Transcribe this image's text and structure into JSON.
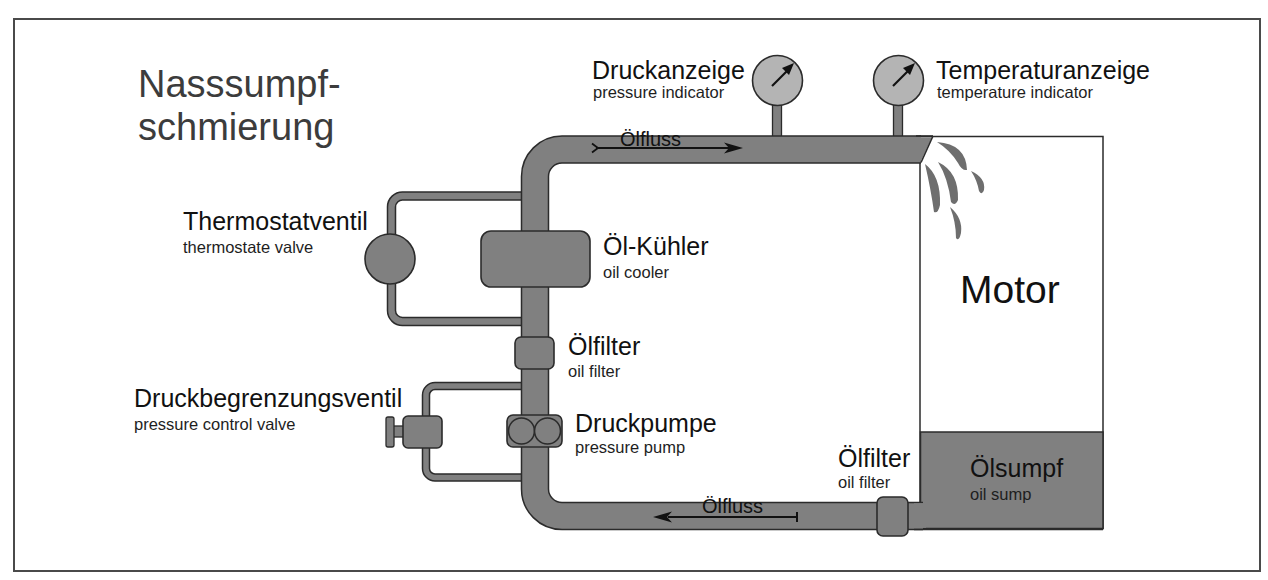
{
  "diagram": {
    "title": {
      "line1": "Nasssumpf-",
      "line2": "schmierung"
    },
    "components": {
      "pressure_indicator": {
        "de": "Druckanzeige",
        "en": "pressure indicator",
        "icon": "pressure-gauge-icon"
      },
      "temperature_indicator": {
        "de": "Temperaturanzeige",
        "en": "temperature indicator",
        "icon": "temperature-gauge-icon"
      },
      "thermostat_valve": {
        "de": "Thermostatventil",
        "en": "thermostate valve",
        "icon": "valve-circle-icon"
      },
      "oil_cooler": {
        "de": "Öl-Kühler",
        "en": "oil cooler",
        "icon": "cooler-block-icon"
      },
      "oil_filter_main": {
        "de": "Ölfilter",
        "en": "oil filter",
        "icon": "filter-block-icon"
      },
      "pressure_control_valve": {
        "de": "Druckbegrenzungsventil",
        "en": "pressure control valve",
        "icon": "relief-valve-icon"
      },
      "pressure_pump": {
        "de": "Druckpumpe",
        "en": "pressure pump",
        "icon": "gear-pump-icon"
      },
      "oil_filter_sump": {
        "de": "Ölfilter",
        "en": "oil filter",
        "icon": "filter-block-icon"
      },
      "oil_sump": {
        "de": "Ölsumpf",
        "en": "oil sump"
      },
      "motor": {
        "label": "Motor",
        "icon": "oil-splash-icon"
      }
    },
    "flow": {
      "top": {
        "label": "Ölfluss",
        "direction": "right"
      },
      "bottom": {
        "label": "Ölfluss",
        "direction": "left"
      }
    }
  },
  "colors": {
    "pipe": "#808080",
    "pipe-dark": "#2b2b2b",
    "gauge": "#b4b4b4",
    "frame": "#4a4a4a",
    "title": "#3c3c3c",
    "label": "#111111",
    "sublabel": "#1e1e1e"
  }
}
